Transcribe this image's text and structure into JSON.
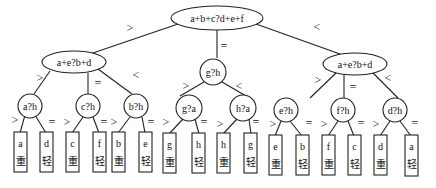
{
  "diagram": {
    "root": {
      "label": "a+b+c?d+e+f"
    },
    "level2": [
      {
        "label": "a+e?b+d"
      },
      {
        "label": "g?h"
      },
      {
        "label": "a+e?b+d"
      }
    ],
    "level3": [
      {
        "label": "a?h"
      },
      {
        "label": "c?h"
      },
      {
        "label": "b?h"
      },
      {
        "label": "g?a"
      },
      {
        "label": "h?a"
      },
      {
        "label": "e?h"
      },
      {
        "label": "f?h"
      },
      {
        "label": "d?h"
      }
    ],
    "leaves": [
      {
        "coin": "a",
        "result": "重"
      },
      {
        "coin": "d",
        "result": "轻"
      },
      {
        "coin": "c",
        "result": "重"
      },
      {
        "coin": "f",
        "result": "轻"
      },
      {
        "coin": "b",
        "result": "重"
      },
      {
        "coin": "e",
        "result": "轻"
      },
      {
        "coin": "g",
        "result": "重"
      },
      {
        "coin": "h",
        "result": "轻"
      },
      {
        "coin": "h",
        "result": "重"
      },
      {
        "coin": "g",
        "result": "轻"
      },
      {
        "coin": "e",
        "result": "重"
      },
      {
        "coin": "b",
        "result": "轻"
      },
      {
        "coin": "f",
        "result": "重"
      },
      {
        "coin": "c",
        "result": "轻"
      },
      {
        "coin": "d",
        "result": "重"
      },
      {
        "coin": "a",
        "result": "轻"
      }
    ],
    "symbols": {
      "gt": ">",
      "eq": "=",
      "lt": "<"
    }
  }
}
